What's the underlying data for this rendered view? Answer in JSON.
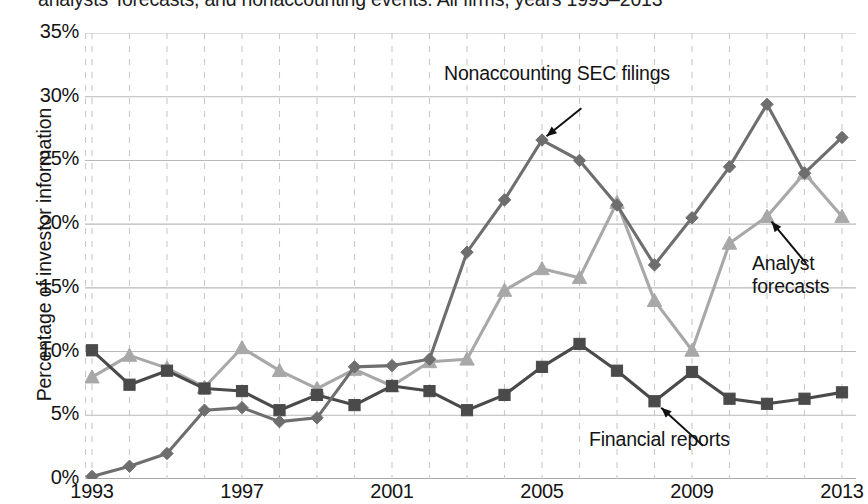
{
  "caption": "analysts' forecasts, and nonaccounting events. All firms, years 1993–2013",
  "axes": {
    "ylabel": "Percentage of investor information",
    "xlabel": "",
    "yticks": [
      "0%",
      "5%",
      "10%",
      "15%",
      "20%",
      "25%",
      "30%",
      "35%"
    ],
    "xticks": [
      "1993",
      "1997",
      "2001",
      "2005",
      "2009",
      "2013"
    ]
  },
  "annotations": {
    "sec_filings": "Nonaccounting SEC filings",
    "analyst_forecasts": "Analyst\nforecasts",
    "financial_reports": "Financial reports"
  },
  "colors": {
    "sec_filings": "#6e6e6e",
    "analyst_forecasts": "#a8a8a8",
    "financial_reports": "#4a4a4a",
    "gridline_solid": "#b9b9b9",
    "gridline_dashed": "#c9c9c9",
    "axis": "#8a8a8a",
    "text": "#141414"
  },
  "chart_data": {
    "type": "line",
    "title": "analysts' forecasts, and nonaccounting events. All firms, years 1993–2013",
    "xlabel": "",
    "ylabel": "Percentage of investor information",
    "xlim": [
      1993,
      2013
    ],
    "ylim": [
      0,
      35
    ],
    "yunit": "%",
    "grid": true,
    "legend": "annotated-inline",
    "x": [
      1993,
      1994,
      1995,
      1996,
      1997,
      1998,
      1999,
      2000,
      2001,
      2002,
      2003,
      2004,
      2005,
      2006,
      2007,
      2008,
      2009,
      2010,
      2011,
      2012,
      2013
    ],
    "series": [
      {
        "name": "Nonaccounting SEC filings",
        "marker": "diamond",
        "color": "#6e6e6e",
        "values": [
          0.2,
          1.0,
          2.0,
          5.4,
          5.6,
          4.5,
          4.8,
          8.8,
          8.9,
          9.4,
          17.8,
          21.9,
          26.6,
          25.0,
          21.5,
          16.8,
          20.5,
          24.5,
          29.4,
          24.0,
          26.8
        ]
      },
      {
        "name": "Analyst forecasts",
        "marker": "triangle",
        "color": "#a8a8a8",
        "values": [
          8.0,
          9.7,
          8.7,
          7.2,
          10.3,
          8.5,
          7.1,
          8.6,
          7.3,
          9.2,
          9.4,
          14.8,
          16.5,
          15.8,
          21.7,
          14.0,
          10.1,
          18.5,
          20.6,
          24.0,
          20.6
        ]
      },
      {
        "name": "Financial reports",
        "marker": "square",
        "color": "#4a4a4a",
        "values": [
          10.1,
          7.4,
          8.5,
          7.1,
          6.9,
          5.4,
          6.6,
          5.8,
          7.3,
          6.9,
          5.4,
          6.6,
          8.8,
          10.6,
          8.5,
          6.1,
          8.4,
          6.3,
          5.9,
          6.3,
          6.8
        ]
      }
    ]
  }
}
